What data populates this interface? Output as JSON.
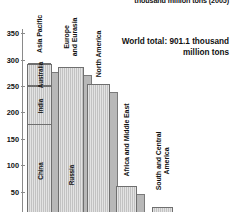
{
  "title": "thousand million tons (2005)",
  "annotation": "World total: 901.1 thousand\nmillion tons",
  "axis": {
    "ticks": [
      {
        "label": "350",
        "value": 350
      },
      {
        "label": "300",
        "value": 300
      },
      {
        "label": "250",
        "value": 250
      },
      {
        "label": "200",
        "value": 200
      },
      {
        "label": "150",
        "value": 150
      },
      {
        "label": "100",
        "value": 100
      },
      {
        "label": "50",
        "value": 50
      }
    ]
  },
  "bars": [
    {
      "label": "Asia Pacific",
      "value": 292,
      "segments": [
        {
          "label": "China",
          "top": 175
        },
        {
          "label": "India",
          "top": 249
        },
        {
          "label": "Australia",
          "top": 292
        }
      ]
    },
    {
      "label": "Europe\nand Eurasia",
      "value": 287,
      "segments": [
        {
          "label": "Russia",
          "top": 160
        }
      ]
    },
    {
      "label": "North America",
      "value": 254,
      "segments": []
    },
    {
      "label": "Africa and Middle East",
      "value": 60,
      "segments": []
    },
    {
      "label": "South and Central America",
      "value": 20,
      "segments": []
    }
  ],
  "chart_data": {
    "type": "bar",
    "title": "thousand million tons (2005)",
    "subtitle": "",
    "xlabel": "",
    "ylabel": "thousand million tons",
    "ylim": [
      0,
      360
    ],
    "yticks": [
      50,
      100,
      150,
      200,
      250,
      300,
      350
    ],
    "grid": false,
    "legend": "none",
    "annotations": [
      "World total: 901.1 thousand million tons"
    ],
    "categories": [
      "Asia Pacific",
      "Europe and Eurasia",
      "North America",
      "Africa and Middle East",
      "South and Central America"
    ],
    "values": [
      292,
      287,
      254,
      60,
      20
    ],
    "stacked_subcategories": {
      "Asia Pacific": [
        {
          "name": "China",
          "cumulative_top": 175,
          "value": 175
        },
        {
          "name": "India",
          "cumulative_top": 249,
          "value": 74
        },
        {
          "name": "Australia",
          "cumulative_top": 292,
          "value": 43
        }
      ],
      "Europe and Eurasia": [
        {
          "name": "Russia",
          "cumulative_top": 160,
          "value": 160
        }
      ]
    },
    "world_total": 901.1,
    "units": "thousand million tons",
    "year": 2005
  }
}
